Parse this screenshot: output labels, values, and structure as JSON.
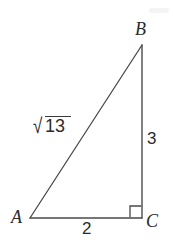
{
  "figure": {
    "type": "right-triangle-diagram",
    "background_color": "#ffffff",
    "stroke_color": "#4a4a4a",
    "text_color": "#2b2b2b",
    "vertices": {
      "a_label": "A",
      "b_label": "B",
      "c_label": "C"
    },
    "sides": {
      "hypotenuse_ab": {
        "radical_sign": "√",
        "radicand": "13",
        "full_text": "√13"
      },
      "leg_bc": "3",
      "leg_ac": "2"
    },
    "right_angle": {
      "at_vertex": "C",
      "marker": "right-angle-square"
    },
    "geometry": {
      "point_a": [
        30,
        218
      ],
      "point_b": [
        142,
        45
      ],
      "point_c": [
        142,
        218
      ]
    }
  }
}
